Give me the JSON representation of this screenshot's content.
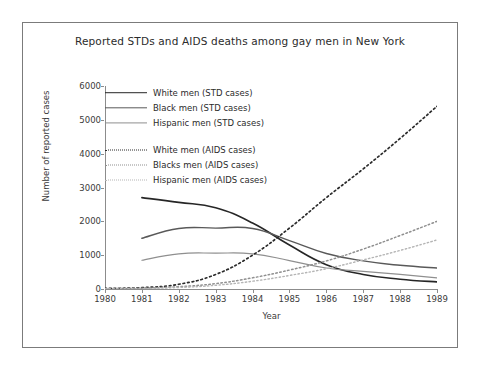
{
  "chart_data": {
    "type": "line",
    "title": "Reported STDs and AIDS deaths among gay men in New York",
    "xlabel": "Year",
    "ylabel": "Number of reported cases",
    "x": [
      1980,
      1981,
      1982,
      1983,
      1984,
      1985,
      1986,
      1987,
      1988,
      1989
    ],
    "xtick_labels": [
      "1980",
      "1981",
      "1982",
      "1983",
      "1984",
      "1985",
      "1986",
      "1987",
      "1988",
      "1989"
    ],
    "ytick_labels": [
      "0",
      "1000",
      "2000",
      "3000",
      "4000",
      "5000",
      "6000"
    ],
    "ytick_values": [
      0,
      1000,
      2000,
      3000,
      4000,
      5000,
      6000
    ],
    "xlim": [
      1980,
      1989
    ],
    "ylim": [
      0,
      6000
    ],
    "grid": false,
    "legend_position": "upper-left inside axes",
    "series": [
      {
        "name": "White men (STD cases)",
        "style": "solid",
        "color": "#262626",
        "width": 1.6,
        "x": [
          1981,
          1982,
          1983,
          1984,
          1985,
          1986,
          1987,
          1988,
          1989
        ],
        "values": [
          2700,
          2560,
          2400,
          1950,
          1300,
          720,
          430,
          290,
          210
        ]
      },
      {
        "name": "Black men (STD cases)",
        "style": "solid",
        "color": "#595959",
        "width": 1.4,
        "x": [
          1981,
          1982,
          1983,
          1984,
          1985,
          1986,
          1987,
          1988,
          1989
        ],
        "values": [
          1500,
          1790,
          1800,
          1790,
          1430,
          1050,
          830,
          700,
          620
        ]
      },
      {
        "name": "Hispanic men (STD cases)",
        "style": "solid",
        "color": "#8f8f8f",
        "width": 1.2,
        "x": [
          1981,
          1982,
          1983,
          1984,
          1985,
          1986,
          1987,
          1988,
          1989
        ],
        "values": [
          850,
          1040,
          1060,
          1040,
          840,
          620,
          520,
          430,
          330
        ]
      },
      {
        "name": "White men (AIDS cases)",
        "style": "dotted",
        "color": "#2b2b2b",
        "width": 1.7,
        "x": [
          1980,
          1981,
          1982,
          1983,
          1984,
          1985,
          1986,
          1987,
          1988,
          1989
        ],
        "values": [
          20,
          40,
          140,
          430,
          1000,
          1800,
          2700,
          3550,
          4450,
          5400
        ]
      },
      {
        "name": "Blacks men (AIDS cases)",
        "style": "dotted",
        "color": "#8f8f8f",
        "width": 1.5,
        "x": [
          1980,
          1981,
          1982,
          1983,
          1984,
          1985,
          1986,
          1987,
          1988,
          1989
        ],
        "values": [
          10,
          25,
          70,
          160,
          330,
          560,
          830,
          1180,
          1580,
          2000
        ]
      },
      {
        "name": "Hispanic men (AIDS cases)",
        "style": "dotted",
        "color": "#b5b5b5",
        "width": 1.4,
        "x": [
          1980,
          1981,
          1982,
          1983,
          1984,
          1985,
          1986,
          1987,
          1988,
          1989
        ],
        "values": [
          5,
          15,
          45,
          110,
          230,
          400,
          600,
          860,
          1140,
          1450
        ]
      }
    ]
  },
  "legend": {
    "group_one": [
      "White men (STD cases)",
      "Black men (STD cases)",
      "Hispanic men (STD cases)"
    ],
    "group_two": [
      "White men (AIDS cases)",
      "Blacks men (AIDS cases)",
      "Hispanic men (AIDS cases)"
    ]
  }
}
